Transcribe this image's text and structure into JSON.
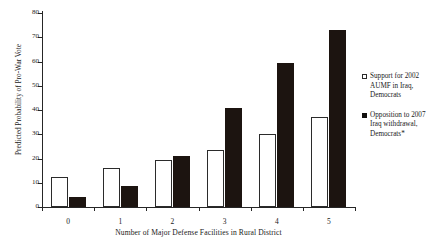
{
  "chart_data": {
    "type": "bar",
    "title": "",
    "xlabel": "Number of Major Defense Facilities in Rural District",
    "ylabel": "Predicted Probability of Pro-War Vote",
    "categories": [
      "0",
      "1",
      "2",
      "3",
      "4",
      "5"
    ],
    "ylim": [
      0,
      80
    ],
    "ytick_step": 10,
    "yticks": [
      "0",
      "10",
      "20",
      "30",
      "40",
      "50",
      "60",
      "70",
      "80"
    ],
    "grid": false,
    "legend_position": "right",
    "series": [
      {
        "name": "Support for 2002\nAUMF in Iraq,\nDemocrats",
        "style": "open",
        "color": "#ffffff",
        "edge_color": "#2b2b2b",
        "values": [
          12.4,
          16.0,
          19.4,
          23.5,
          30.3,
          37.0
        ]
      },
      {
        "name": "Opposition to 2007\nIraq withdrawal,\nDemocrats*",
        "style": "filled",
        "color": "#12100e",
        "edge_color": "#12100e",
        "values": [
          4.2,
          8.8,
          21.0,
          41.0,
          59.5,
          73.0
        ]
      }
    ]
  },
  "axes": {
    "x_title": "Number of Major Defense Facilities in Rural District",
    "y_title": "Predicted Probability of Pro-War Vote"
  },
  "legend": {
    "entries": [
      {
        "marker": "open-square-marker",
        "label": "Support for 2002\nAUMF in Iraq,\nDemocrats"
      },
      {
        "marker": "filled-square-marker",
        "label": "Opposition to 2007\nIraq withdrawal,\nDemocrats*"
      }
    ]
  }
}
